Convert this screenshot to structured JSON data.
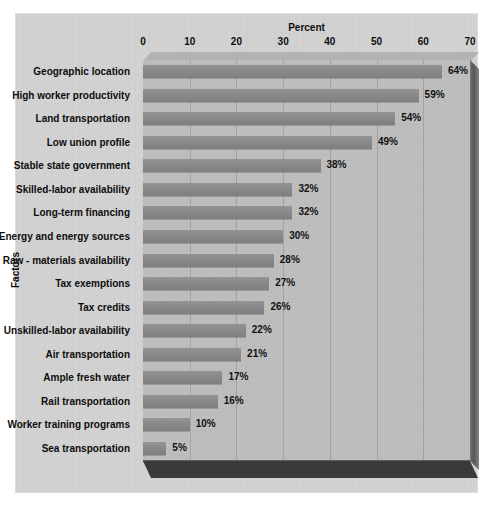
{
  "chart_data": {
    "type": "bar",
    "orientation": "horizontal",
    "title": "Percent",
    "xlabel": "Percent",
    "ylabel": "Factors",
    "xlim": [
      0,
      70
    ],
    "xticks": [
      0,
      10,
      20,
      30,
      40,
      50,
      60,
      70
    ],
    "xtick_labels": [
      "0",
      "10",
      "20",
      "30",
      "40",
      "50",
      "60",
      "70"
    ],
    "grid": true,
    "legend": "none",
    "style": "3d-bar",
    "colors": {
      "bar": "#8b8b8b",
      "plot_background": "#bdbdbd",
      "panel_background": "#d2d2d2",
      "base_shadow": "#3a3a3a",
      "text": "#0d0d0d"
    },
    "categories": [
      "Geographic location",
      "High worker productivity",
      "Land transportation",
      "Low union profile",
      "Stable state government",
      "Skilled-labor availability",
      "Long-term financing",
      "Energy and energy sources",
      "Raw - materials availability",
      "Tax exemptions",
      "Tax credits",
      "Unskilled-labor availability",
      "Air transportation",
      "Ample fresh water",
      "Rail transportation",
      "Worker training programs",
      "Sea transportation"
    ],
    "values": [
      64,
      59,
      54,
      49,
      38,
      32,
      32,
      30,
      28,
      27,
      26,
      22,
      21,
      17,
      16,
      10,
      5
    ],
    "value_labels": [
      "64%",
      "59%",
      "54%",
      "49%",
      "38%",
      "32%",
      "32%",
      "30%",
      "28%",
      "27%",
      "26%",
      "22%",
      "21%",
      "17%",
      "16%",
      "10%",
      "5%"
    ]
  }
}
